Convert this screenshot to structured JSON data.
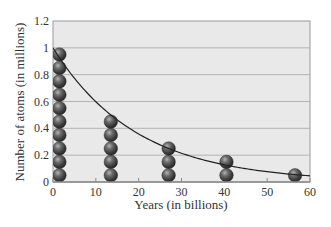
{
  "chart_data": {
    "type": "scatter",
    "title": "",
    "xlabel": "Years (in billions)",
    "ylabel": "Number of atoms (in millions)",
    "xlim": [
      0,
      60
    ],
    "ylim": [
      0,
      1.2
    ],
    "xticks": [
      0,
      10,
      20,
      30,
      40,
      50,
      60
    ],
    "yticks": [
      0,
      0.2,
      0.4,
      0.6,
      0.8,
      1,
      1.2
    ],
    "ytick_labels": [
      "0",
      "0.2",
      "0.4",
      "0.6",
      "0.8",
      "1",
      "1.2"
    ],
    "grid": true,
    "legend": null,
    "half_life_billion_years": 13.5,
    "series": [
      {
        "name": "Remaining atoms (stacked spheres, 0.1 million each)",
        "style": "stacked-spheres",
        "x": [
          1.5,
          13.5,
          27,
          40.5,
          56.5
        ],
        "values": [
          1.0,
          0.5,
          0.25,
          0.125,
          0.0625
        ],
        "sphere_counts": [
          10,
          5,
          3,
          1.5,
          0.5
        ]
      },
      {
        "name": "Exponential decay curve",
        "style": "line",
        "equation": "N = 1.0 * 0.5^(t / 13.5)",
        "x": [
          0,
          10,
          20,
          30,
          40,
          50,
          60
        ],
        "values": [
          1.0,
          0.6,
          0.36,
          0.21,
          0.13,
          0.08,
          0.05
        ]
      }
    ]
  }
}
